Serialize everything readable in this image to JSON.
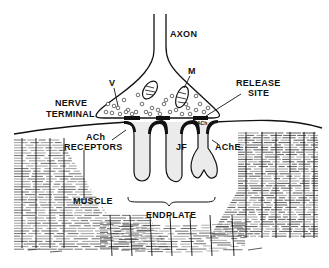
{
  "diagram": {
    "labels": {
      "axon": "AXON",
      "mitochondrion": "M",
      "vesicle": "V",
      "release_site_1": "RELEASE",
      "release_site_2": "SITE",
      "nerve_terminal_1": "NERVE",
      "nerve_terminal_2": "TERMINAL",
      "ach_arrow": "ACh",
      "ach_receptors_1": "ACh",
      "ach_receptors_2": "RECEPTORS",
      "junctional_fold": "JF",
      "acetylcholinesterase": "AChE",
      "muscle": "MUSCLE",
      "endplate": "ENDPLATE"
    },
    "colors": {
      "ink": "#111111",
      "background": "#ffffff",
      "fold_fill": "#ebebeb"
    }
  }
}
